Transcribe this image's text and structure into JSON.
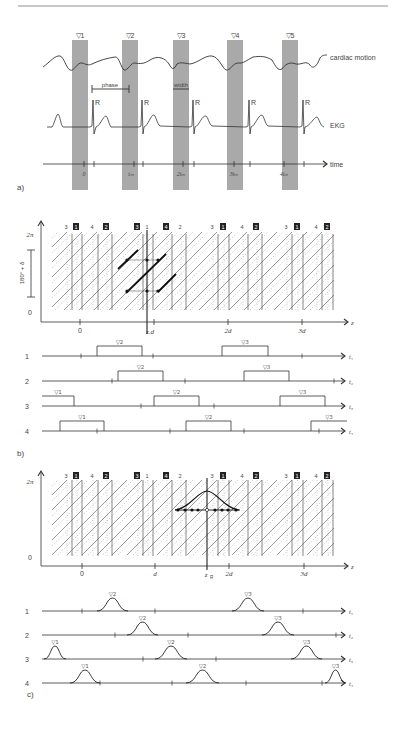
{
  "header_rule": true,
  "panel_a": {
    "label": "a)",
    "triggers": [
      "▽1",
      "▽2",
      "▽3",
      "▽4",
      "▽5"
    ],
    "cardiac_label": "cardiac motion",
    "ekg_label": "EKG",
    "r_label": "R",
    "phase_label": "phase",
    "width_label": "width",
    "time_label": "time",
    "time_ticks": [
      "0",
      "tₘ",
      "2tₘ",
      "3tₘ",
      "4tₘ"
    ]
  },
  "panel_b": {
    "label": "b)",
    "y_top": "2π",
    "y_bottom": "0",
    "y_bracket": "180° + δ",
    "x_axis": "z",
    "x_ticks": [
      "0",
      "zᵣd",
      "2d",
      "3d"
    ],
    "zR": "z",
    "zR_sub": "R",
    "d": "d",
    "detector_row_labels": [
      "3",
      "1",
      "4",
      "2",
      "3",
      "1",
      "4",
      "2",
      "3",
      "1",
      "4",
      "2"
    ],
    "detector_row_boxed": [
      false,
      true,
      false,
      true,
      true,
      false,
      true,
      false,
      false,
      true,
      false,
      true
    ],
    "rows": [
      {
        "label": "1",
        "axis": "t₁",
        "windows": [
          "▽2",
          "▽3"
        ]
      },
      {
        "label": "2",
        "axis": "t₂",
        "windows": [
          "▽2",
          "▽3"
        ]
      },
      {
        "label": "3",
        "axis": "t₃",
        "windows": [
          "▽1",
          "▽2",
          "▽3"
        ]
      },
      {
        "label": "4",
        "axis": "t₄",
        "windows": [
          "▽1",
          "▽2",
          "▽3"
        ]
      }
    ]
  },
  "panel_c": {
    "label": "c)",
    "y_top": "2π",
    "y_bottom": "0",
    "x_axis": "z",
    "x_ticks": [
      "0",
      "d",
      "2d",
      "3d"
    ],
    "zR": "z",
    "zR_sub": "R",
    "rows": [
      {
        "label": "1",
        "axis": "t₁",
        "windows": [
          "▽2",
          "▽3"
        ]
      },
      {
        "label": "2",
        "axis": "t₂",
        "windows": [
          "▽2",
          "▽3"
        ]
      },
      {
        "label": "3",
        "axis": "t₃",
        "windows": [
          "▽1",
          "▽2",
          "▽3"
        ]
      },
      {
        "label": "4",
        "axis": "t₄",
        "windows": [
          "▽1",
          "▽2",
          "▽3"
        ]
      }
    ]
  },
  "colors": {
    "gate_bar": "#a9a9a9",
    "line": "#333333",
    "grid": "#999999"
  }
}
